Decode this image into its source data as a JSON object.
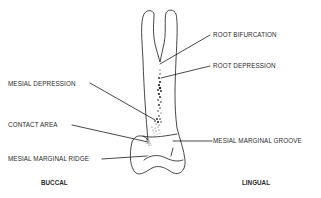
{
  "diagram": {
    "labels": {
      "root_bifurcation": "ROOT BIFURCATION",
      "root_depression": "ROOT DEPRESSION",
      "mesial_depression": "MESIAL DEPRESSION",
      "contact_area": "CONTACT AREA",
      "mesial_marginal_groove": "MESIAL MARGINAL GROOVE",
      "mesial_marginal_ridge": "MESIAL MARGINAL RIDGE"
    },
    "orientation": {
      "left": "BUCCAL",
      "right": "LINGUAL"
    },
    "colors": {
      "line": "#1a1a1a",
      "text": "#2a2a2a",
      "background": "#ffffff"
    }
  }
}
